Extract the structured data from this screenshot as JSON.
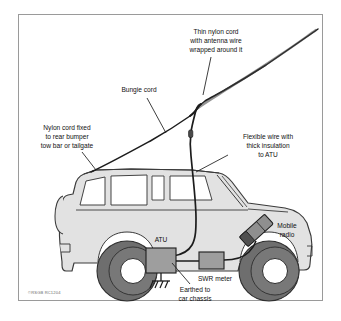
{
  "figure": {
    "border_color": "#9a9a9a",
    "background": "#ffffff",
    "body_color": "#e2e2e2",
    "body_outline": "#3a3a3a",
    "tire_color": "#6e6e6e",
    "hub_color": "#ffffff",
    "glass_color": "#ffffff",
    "box_fill": "#9e9e9e",
    "wire_color": "#1c1c1c",
    "copyright": "©RSGB RC1204"
  },
  "labels": {
    "thin_nylon_cord": {
      "lines": [
        "Thin nylon cord",
        "with antenna wire",
        "wrapped around it"
      ],
      "line1": "Thin nylon cord",
      "line2": "with antenna wire",
      "line3": "wrapped around it"
    },
    "bungie_cord": {
      "line1": "Bungie cord"
    },
    "nylon_cord_fixed": {
      "lines": [
        "Nylon cord fixed",
        "to rear bumper",
        "tow bar or tailgate"
      ],
      "line1": "Nylon cord fixed",
      "line2": "to rear bumper",
      "line3": "tow bar or tailgate"
    },
    "flexible_wire": {
      "lines": [
        "Flexible wire with",
        "thick insulation",
        "to ATU"
      ],
      "line1": "Flexible wire with",
      "line2": "thick insulation",
      "line3": "to ATU"
    },
    "mobile_radio": {
      "lines": [
        "Mobile",
        "radio"
      ],
      "line1": "Mobile",
      "line2": "radio"
    },
    "atu": {
      "line1": "ATU"
    },
    "swr_meter": {
      "line1": "SWR meter"
    },
    "earthed": {
      "lines": [
        "Earthed to",
        "car chassis"
      ],
      "line1": "Earthed to",
      "line2": "car chassis"
    }
  },
  "components": [
    {
      "id": "atu",
      "name": "ATU",
      "label": "ATU"
    },
    {
      "id": "swr-meter",
      "name": "SWR meter",
      "label": "SWR meter"
    },
    {
      "id": "mobile-radio",
      "name": "Mobile radio",
      "label": "Mobile radio"
    },
    {
      "id": "ground",
      "name": "Earth / chassis ground",
      "label": "Earthed to car chassis"
    }
  ]
}
